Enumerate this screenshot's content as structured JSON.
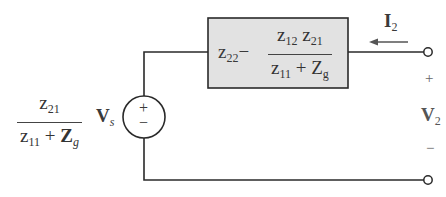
{
  "diagram": {
    "type": "circuit",
    "source": {
      "coefficient": {
        "numerator": "z21",
        "denominator": "z11 + Zg"
      },
      "variable": "Vs",
      "polarity_top": "+",
      "polarity_bottom": "−"
    },
    "impedance_box": {
      "prefix": "z22",
      "minus": "−",
      "numerator": "z12 z21",
      "denominator": "z11 + Zg",
      "fill": "#e2e2e2"
    },
    "current": {
      "label": "I2",
      "direction": "left"
    },
    "port_voltage": {
      "label": "V2",
      "plus": "+",
      "minus": "−"
    },
    "labels": {
      "z": "z",
      "Z": "Z",
      "V": "V",
      "I": "I",
      "sub_21": "21",
      "sub_11": "11",
      "sub_22": "22",
      "sub_12": "12",
      "sub_g": "g",
      "sub_s": "s",
      "sub_2": "2",
      "plus_sign": "+",
      "minus_sign": "−"
    }
  }
}
